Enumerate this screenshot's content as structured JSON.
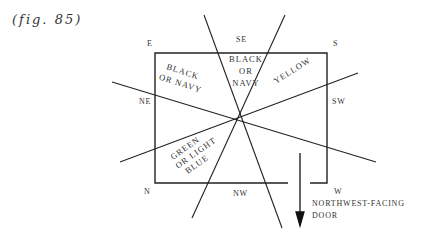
{
  "figure": {
    "label": "(fig. 85)"
  },
  "compass": {
    "E": "E",
    "SE": "SE",
    "S": "S",
    "NE": "NE",
    "SW": "SW",
    "N": "N",
    "NW": "NW",
    "W": "W"
  },
  "zones": {
    "east_line1": "BLACK",
    "east_line2": "OR NAVY",
    "southeast_line1": "BLACK",
    "southeast_line2": "OR",
    "southeast_line3": "NAVY",
    "southwest": "YELLOW",
    "north_line1": "GREEN",
    "north_line2": "OR LIGHT",
    "north_line3": "BLUE"
  },
  "door": {
    "line1": "NORTHWEST-FACING",
    "line2": "DOOR"
  }
}
